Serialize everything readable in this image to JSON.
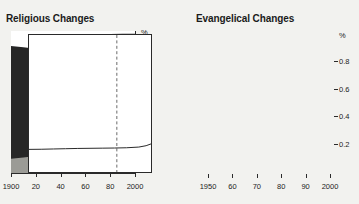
{
  "figure": {
    "background_color": "#f2f2ef",
    "ink_color": "#1b1b1b"
  },
  "panels": [
    {
      "key": "religious",
      "title": "Religious Changes",
      "percent_symbol": "%"
    },
    {
      "key": "evangelical",
      "title": "Evangelical Changes",
      "percent_symbol": "%"
    }
  ],
  "chart_data": [
    {
      "type": "area",
      "title": "Religious Changes",
      "xlabel": "",
      "ylabel": "%",
      "xlim": [
        1900,
        2000
      ],
      "ylim": [
        0,
        100
      ],
      "grid": false,
      "legend": "inline-labels",
      "xticks": [
        1900,
        1920,
        1940,
        1960,
        1980,
        2000
      ],
      "xticklabels": [
        "1900",
        "20",
        "40",
        "60",
        "80",
        "2000"
      ],
      "yticks": [
        20,
        40,
        60,
        80
      ],
      "yticklabels": [
        "20",
        "40",
        "60",
        "80"
      ],
      "annotations": [
        {
          "label": "M",
          "x": 1947,
          "y": 62,
          "color": "#000000",
          "box": "#ffffff"
        },
        {
          "label": "H",
          "x": 1919,
          "y": 13,
          "color": "#000000",
          "box": "#ffffff"
        }
      ],
      "series": [
        {
          "name": "M",
          "fill": "#262626",
          "x": [
            1900,
            1910,
            1920,
            1930,
            1940,
            1950,
            1960,
            1965,
            1970,
            1980,
            1990,
            2000
          ],
          "values": [
            89.5,
            88.5,
            87.5,
            86.5,
            87.0,
            88.5,
            92.5,
            96.5,
            97.5,
            97.8,
            98.0,
            98.0
          ]
        },
        {
          "name": "H",
          "fill": "#9b9b96",
          "x": [
            1900,
            1910,
            1920,
            1930,
            1940,
            1950,
            1960,
            1965,
            1970,
            1980,
            1990,
            2000
          ],
          "values": [
            10.0,
            11.0,
            12.0,
            13.0,
            12.5,
            11.0,
            7.0,
            3.0,
            2.0,
            1.8,
            1.6,
            1.6
          ]
        }
      ]
    },
    {
      "type": "line",
      "title": "Evangelical Changes",
      "xlabel": "",
      "ylabel": "%",
      "xlim": [
        1950,
        2000
      ],
      "ylim": [
        0,
        1.0
      ],
      "grid": false,
      "legend": "none",
      "xticks": [
        1950,
        1960,
        1970,
        1980,
        1990,
        2000
      ],
      "xticklabels": [
        "1950",
        "60",
        "70",
        "80",
        "90",
        "2000"
      ],
      "yticks": [
        0.2,
        0.4,
        0.6,
        0.8
      ],
      "yticklabels": [
        "0.2",
        "0.4",
        "0.6",
        "0.8"
      ],
      "reference_line": {
        "x": 1986,
        "style": "dashed",
        "color": "#6b6b6b"
      },
      "series": [
        {
          "name": "evangelical-share",
          "color": "#2a2a2a",
          "x": [
            1950,
            1955,
            1960,
            1965,
            1970,
            1975,
            1980,
            1985,
            1990,
            1995,
            1998,
            2000
          ],
          "values": [
            0.165,
            0.166,
            0.168,
            0.17,
            0.172,
            0.173,
            0.174,
            0.175,
            0.177,
            0.182,
            0.192,
            0.205
          ]
        }
      ]
    }
  ]
}
